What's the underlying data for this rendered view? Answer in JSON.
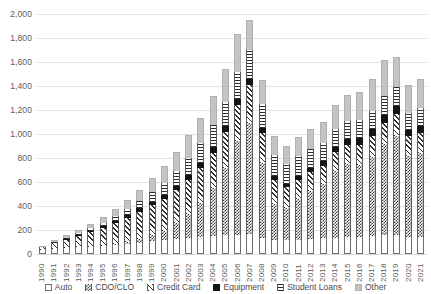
{
  "chart_data": {
    "type": "bar",
    "subtype": "stacked-column",
    "title": "",
    "subtitle": "",
    "xlabel": "",
    "ylabel": "",
    "ylim": [
      0,
      2000
    ],
    "y_ticks": [
      "0",
      "200",
      "400",
      "600",
      "800",
      "1,000",
      "1,200",
      "1,400",
      "1,600",
      "1,800",
      "2,000"
    ],
    "y_tick_values": [
      0,
      200,
      400,
      600,
      800,
      1000,
      1200,
      1400,
      1600,
      1800,
      2000
    ],
    "grid": "horizontal",
    "legend_position": "bottom",
    "categories": [
      "1990",
      "1991",
      "1992",
      "1993",
      "1994",
      "1995",
      "1996",
      "1997",
      "1998",
      "1999",
      "2000",
      "2001",
      "2002",
      "2003",
      "2004",
      "2005",
      "2006",
      "2007",
      "2008",
      "2009",
      "2010",
      "2011",
      "2012",
      "2013",
      "2014",
      "2015",
      "2016",
      "2017",
      "2018",
      "2019",
      "2020",
      "2021"
    ],
    "series": [
      {
        "name": "Auto",
        "pattern": "solid-white",
        "color": "#ffffff",
        "values": [
          30,
          42,
          48,
          55,
          62,
          70,
          78,
          85,
          92,
          105,
          115,
          125,
          135,
          145,
          150,
          155,
          160,
          165,
          135,
          120,
          115,
          120,
          125,
          130,
          135,
          140,
          145,
          150,
          155,
          160,
          140,
          145
        ]
      },
      {
        "name": "CDO/CLO",
        "pattern": "checkerboard",
        "color": "#3a3a3a",
        "values": [
          0,
          0,
          0,
          0,
          0,
          0,
          5,
          15,
          30,
          50,
          80,
          130,
          200,
          280,
          400,
          560,
          780,
          930,
          620,
          300,
          270,
          340,
          400,
          450,
          560,
          610,
          600,
          660,
          760,
          820,
          680,
          700
        ]
      },
      {
        "name": "Credit Card",
        "pattern": "diagonal-hatch",
        "color": "#2e2e2e",
        "values": [
          25,
          48,
          70,
          95,
          120,
          150,
          175,
          200,
          230,
          250,
          265,
          275,
          285,
          290,
          295,
          300,
          305,
          310,
          250,
          200,
          170,
          160,
          155,
          150,
          155,
          160,
          165,
          170,
          180,
          185,
          160,
          165
        ]
      },
      {
        "name": "Equipment",
        "pattern": "solid-black",
        "color": "#151515",
        "values": [
          3,
          5,
          8,
          10,
          13,
          16,
          20,
          24,
          28,
          32,
          36,
          38,
          40,
          42,
          45,
          48,
          50,
          52,
          42,
          32,
          30,
          34,
          38,
          42,
          46,
          50,
          54,
          58,
          62,
          66,
          52,
          56
        ]
      },
      {
        "name": "Student Loans",
        "pattern": "horizontal-lines",
        "color": "#2b2b2b",
        "values": [
          2,
          4,
          7,
          12,
          18,
          26,
          36,
          48,
          62,
          80,
          100,
          120,
          140,
          165,
          185,
          205,
          225,
          245,
          205,
          175,
          165,
          160,
          155,
          150,
          150,
          150,
          150,
          155,
          160,
          165,
          145,
          150
        ]
      },
      {
        "name": "Other",
        "pattern": "solid-gray",
        "color": "#c4c4c4",
        "values": [
          10,
          16,
          22,
          30,
          40,
          50,
          62,
          78,
          95,
          115,
          140,
          165,
          190,
          215,
          245,
          275,
          310,
          250,
          200,
          160,
          150,
          160,
          170,
          180,
          195,
          215,
          235,
          265,
          300,
          245,
          230,
          240
        ]
      }
    ],
    "totals": [
      70,
      115,
      155,
      202,
      253,
      312,
      376,
      450,
      537,
      632,
      736,
      853,
      990,
      1137,
      1320,
      1543,
      1830,
      1952,
      1452,
      987,
      900,
      974,
      1043,
      1102,
      1241,
      1325,
      1349,
      1458,
      1617,
      1641,
      1407,
      1456
    ]
  },
  "legend": {
    "items": [
      {
        "label": "Auto"
      },
      {
        "label": "CDO/CLO"
      },
      {
        "label": "Credit Card"
      },
      {
        "label": "Equipment"
      },
      {
        "label": "Student Loans"
      },
      {
        "label": "Other"
      }
    ]
  }
}
